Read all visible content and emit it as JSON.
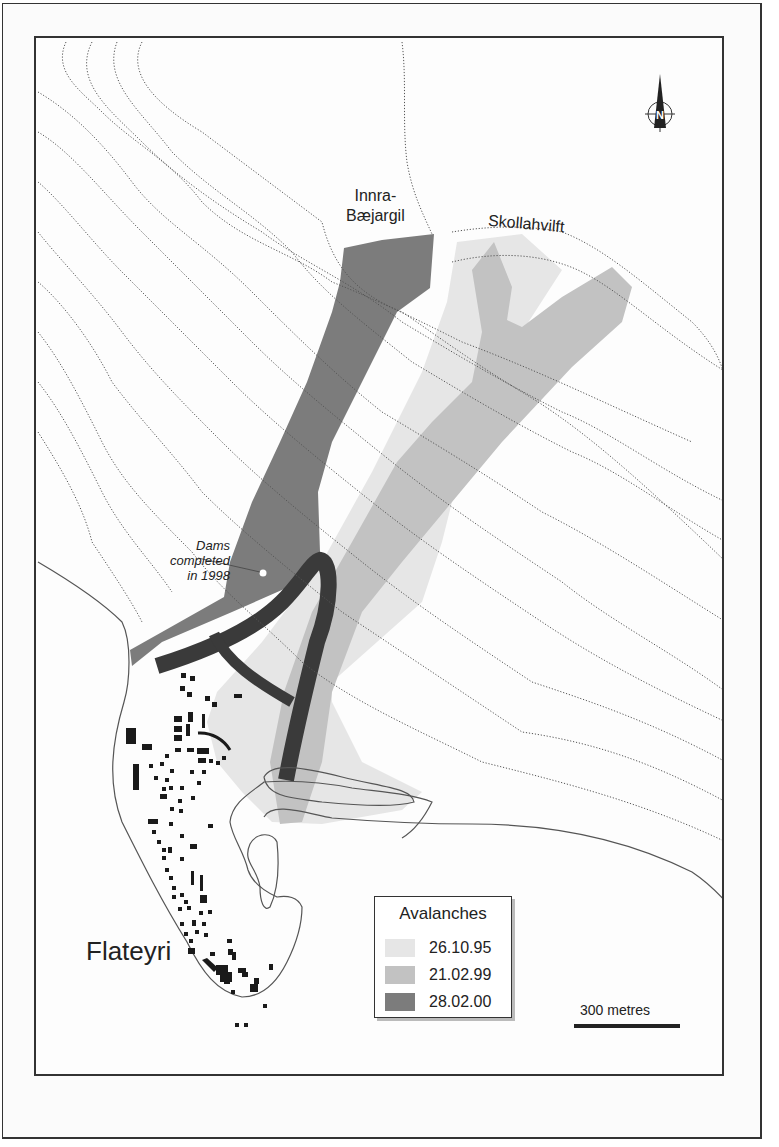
{
  "map": {
    "town_name": "Flateyri",
    "gullies": [
      {
        "line1": "Innra-",
        "line2": "Bæjargil"
      },
      {
        "name": "Skollahvilft"
      }
    ],
    "dams_annotation": {
      "line1": "Dams",
      "line2": "completed",
      "line3": "in 1998"
    },
    "north_arrow": {
      "letter": "N"
    },
    "legend": {
      "title": "Avalanches",
      "items": [
        {
          "date": "26.10.95",
          "color": "#e6e6e6"
        },
        {
          "date": "21.02.99",
          "color": "#c2c2c2"
        },
        {
          "date": "28.02.00",
          "color": "#7c7c7c"
        }
      ]
    },
    "scale_bar": {
      "label": "300 metres"
    },
    "colors": {
      "avalanche_1995": "#e6e6e6",
      "avalanche_1999": "#c2c2c2",
      "avalanche_2000": "#7c7c7c",
      "dams": "#3a3a3a",
      "buildings": "#1a1a1a",
      "contours": "#555555"
    }
  }
}
